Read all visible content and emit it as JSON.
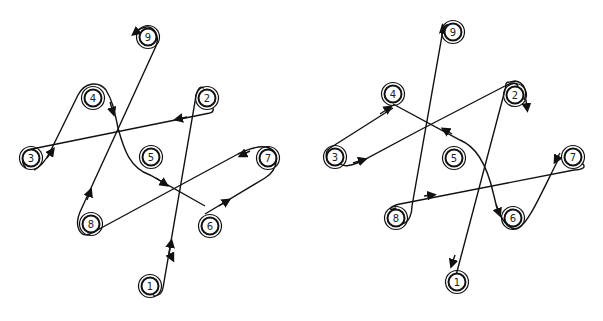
{
  "diagrams": [
    {
      "id": "left",
      "nodes": [
        {
          "label": "1",
          "x": 150,
          "y": 286
        },
        {
          "label": "2",
          "x": 207,
          "y": 98
        },
        {
          "label": "3",
          "x": 31,
          "y": 158
        },
        {
          "label": "4",
          "x": 93,
          "y": 98
        },
        {
          "label": "5",
          "x": 151,
          "y": 157
        },
        {
          "label": "6",
          "x": 210,
          "y": 226
        },
        {
          "label": "7",
          "x": 268,
          "y": 158
        },
        {
          "label": "8",
          "x": 91,
          "y": 224
        },
        {
          "label": "9",
          "x": 148,
          "y": 37
        }
      ],
      "path_order": [
        "1",
        "2",
        "3",
        "4",
        "5",
        "6",
        "7",
        "8",
        "9"
      ]
    },
    {
      "id": "right",
      "nodes": [
        {
          "label": "1",
          "x": 457,
          "y": 282
        },
        {
          "label": "2",
          "x": 515,
          "y": 95
        },
        {
          "label": "3",
          "x": 335,
          "y": 157
        },
        {
          "label": "4",
          "x": 393,
          "y": 94
        },
        {
          "label": "5",
          "x": 454,
          "y": 158
        },
        {
          "label": "6",
          "x": 513,
          "y": 218
        },
        {
          "label": "7",
          "x": 573,
          "y": 157
        },
        {
          "label": "8",
          "x": 396,
          "y": 218
        },
        {
          "label": "9",
          "x": 453,
          "y": 32
        }
      ],
      "path_order": [
        "1",
        "2",
        "3",
        "4",
        "5",
        "6",
        "7",
        "8",
        "9"
      ]
    }
  ]
}
